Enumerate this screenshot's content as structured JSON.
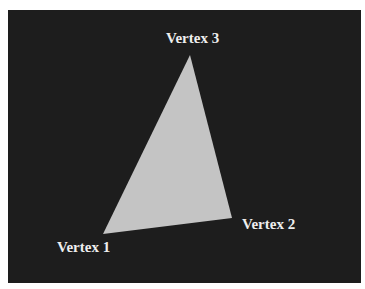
{
  "diagram": {
    "background_color": "#1d1d1d",
    "triangle_color": "#c4c4c4",
    "label_color": "#eeeeee",
    "vertices": [
      {
        "label": "Vertex 1",
        "x": 103,
        "y": 234
      },
      {
        "label": "Vertex 2",
        "x": 232,
        "y": 218
      },
      {
        "label": "Vertex 3",
        "x": 190,
        "y": 55
      }
    ]
  }
}
